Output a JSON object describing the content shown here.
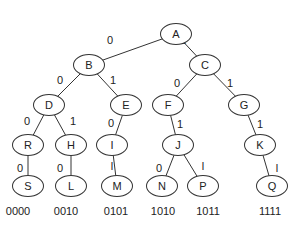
{
  "tree": {
    "nodes": [
      {
        "id": "A",
        "x": 176,
        "y": 34
      },
      {
        "id": "B",
        "x": 89,
        "y": 65
      },
      {
        "id": "C",
        "x": 205,
        "y": 65
      },
      {
        "id": "D",
        "x": 49,
        "y": 105
      },
      {
        "id": "E",
        "x": 126,
        "y": 105
      },
      {
        "id": "F",
        "x": 168,
        "y": 105
      },
      {
        "id": "G",
        "x": 244,
        "y": 105
      },
      {
        "id": "R",
        "x": 28,
        "y": 145
      },
      {
        "id": "H",
        "x": 71,
        "y": 145
      },
      {
        "id": "I",
        "x": 112,
        "y": 145
      },
      {
        "id": "J",
        "x": 178,
        "y": 145
      },
      {
        "id": "K",
        "x": 260,
        "y": 145
      },
      {
        "id": "S",
        "x": 28,
        "y": 186
      },
      {
        "id": "L",
        "x": 71,
        "y": 186
      },
      {
        "id": "M",
        "x": 117,
        "y": 186
      },
      {
        "id": "N",
        "x": 162,
        "y": 186
      },
      {
        "id": "P",
        "x": 203,
        "y": 186
      },
      {
        "id": "Q",
        "x": 272,
        "y": 186
      }
    ],
    "edges": [
      {
        "from": "A",
        "to": "B",
        "label": "0",
        "lx": 110,
        "ly": 40
      },
      {
        "from": "A",
        "to": "C",
        "label": "1",
        "lx": 183,
        "ly": 40
      },
      {
        "from": "B",
        "to": "D",
        "label": "0",
        "lx": 60,
        "ly": 80
      },
      {
        "from": "B",
        "to": "E",
        "label": "1",
        "lx": 113,
        "ly": 80
      },
      {
        "from": "C",
        "to": "F",
        "label": "0",
        "lx": 177,
        "ly": 83
      },
      {
        "from": "C",
        "to": "G",
        "label": "1",
        "lx": 230,
        "ly": 83
      },
      {
        "from": "D",
        "to": "R",
        "label": "0",
        "lx": 27,
        "ly": 121
      },
      {
        "from": "D",
        "to": "H",
        "label": "1",
        "lx": 73,
        "ly": 121
      },
      {
        "from": "E",
        "to": "I",
        "label": "0",
        "lx": 111,
        "ly": 123
      },
      {
        "from": "F",
        "to": "J",
        "label": "1",
        "lx": 180,
        "ly": 124
      },
      {
        "from": "G",
        "to": "K",
        "label": "1",
        "lx": 260,
        "ly": 124
      },
      {
        "from": "R",
        "to": "S",
        "label": "0",
        "lx": 20,
        "ly": 168
      },
      {
        "from": "H",
        "to": "L",
        "label": "0",
        "lx": 60,
        "ly": 168
      },
      {
        "from": "I",
        "to": "M",
        "label": "l",
        "lx": 112,
        "ly": 166
      },
      {
        "from": "J",
        "to": "N",
        "label": "0",
        "lx": 159,
        "ly": 168
      },
      {
        "from": "J",
        "to": "P",
        "label": "l",
        "lx": 203,
        "ly": 166
      },
      {
        "from": "K",
        "to": "Q",
        "label": "l",
        "lx": 277,
        "ly": 168
      }
    ],
    "codes": [
      {
        "text": "0000",
        "x": 18
      },
      {
        "text": "0010",
        "x": 66
      },
      {
        "text": "0101",
        "x": 116
      },
      {
        "text": "1010",
        "x": 163
      },
      {
        "text": "1011",
        "x": 208
      },
      {
        "text": "1111",
        "x": 270
      }
    ]
  }
}
